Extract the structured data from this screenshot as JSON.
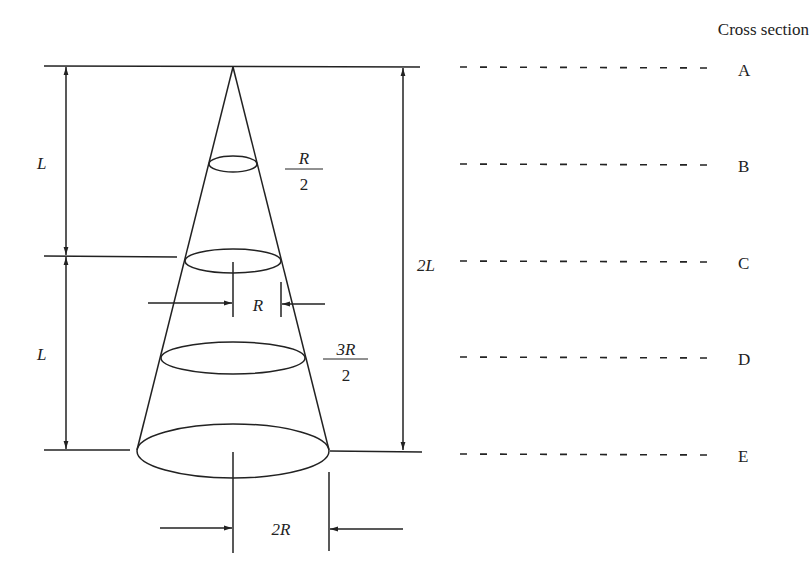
{
  "figure": {
    "header": "Cross section",
    "cone": {
      "apex_label": "A",
      "dimensions": {
        "upper_length": "L",
        "lower_length": "L",
        "total_length": "2L",
        "radius_B": {
          "num": "R",
          "den": "2"
        },
        "radius_C": "R",
        "radius_D": {
          "num": "3R",
          "den": "2"
        },
        "radius_E": "2R"
      }
    },
    "sections": [
      {
        "id": "A"
      },
      {
        "id": "B"
      },
      {
        "id": "C"
      },
      {
        "id": "D"
      },
      {
        "id": "E"
      }
    ]
  },
  "colors": {
    "stroke": "#222222",
    "background": "#ffffff"
  }
}
